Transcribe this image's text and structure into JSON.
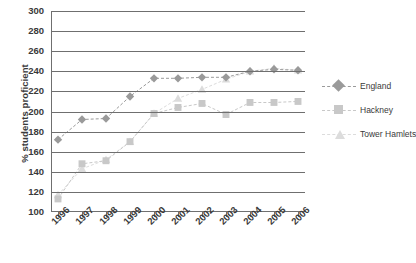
{
  "chart_data": {
    "type": "line",
    "title": "",
    "xlabel": "",
    "ylabel": "% students proficient",
    "categories": [
      "1996",
      "1997",
      "1998",
      "1999",
      "2000",
      "2001",
      "2002",
      "2003",
      "2004",
      "2005",
      "2006"
    ],
    "ylim": [
      100,
      300
    ],
    "ytick_step": 20,
    "yticks": [
      300,
      280,
      260,
      240,
      220,
      200,
      180,
      160,
      140,
      120,
      100
    ],
    "grid": true,
    "legend_position": "right",
    "series": [
      {
        "name": "England",
        "marker": "diamond",
        "color": "#9a9a9a",
        "values": [
          172,
          192,
          193,
          215,
          233,
          233,
          234,
          234,
          240,
          242,
          241
        ]
      },
      {
        "name": "Hackney",
        "marker": "square",
        "color": "#c8c8c8",
        "values": [
          113,
          148,
          151,
          170,
          198,
          204,
          208,
          197,
          209,
          209,
          210
        ]
      },
      {
        "name": "Tower Hamlets",
        "marker": "triangle",
        "color": "#dcdcdc",
        "values": [
          117,
          143,
          152,
          170,
          198,
          213,
          222,
          232,
          240,
          243,
          241
        ]
      }
    ]
  },
  "legend": {
    "items": [
      {
        "label": "England"
      },
      {
        "label": "Hackney"
      },
      {
        "label": "Tower Hamlets"
      }
    ]
  },
  "colors": {
    "axis": "#6f6f6f",
    "text": "#3a3a3a",
    "england": "#9a9a9a",
    "hackney": "#c8c8c8",
    "tower_hamlets": "#dcdcdc"
  }
}
